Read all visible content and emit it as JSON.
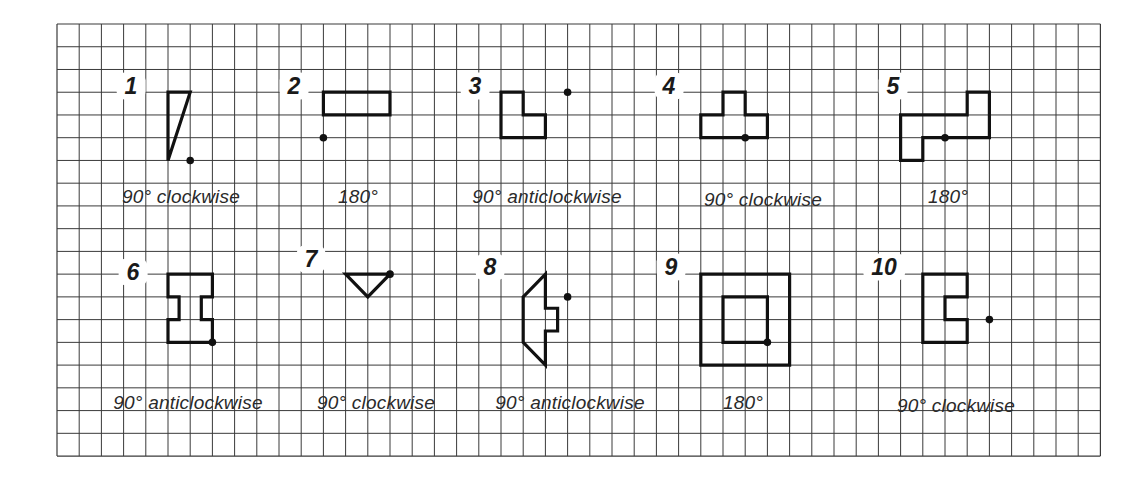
{
  "grid": {
    "left": 57,
    "top": 24,
    "cols": 47,
    "rows": 19,
    "cell_w": 22.2,
    "cell_h": 22.74,
    "line_color": "#3a3a3a",
    "shape_color": "#111111"
  },
  "exercises": [
    {
      "number": "1",
      "instruction": "90° clockwise",
      "number_pos": [
        131,
        86
      ],
      "caption_pos": [
        181,
        197
      ],
      "shapes": [
        [
          [
            5,
            3
          ],
          [
            6,
            3
          ],
          [
            5,
            6
          ]
        ]
      ],
      "centre": [
        6,
        6
      ]
    },
    {
      "number": "2",
      "instruction": "180°",
      "number_pos": [
        294,
        86
      ],
      "caption_pos": [
        358,
        197
      ],
      "shapes": [
        [
          [
            12,
            3
          ],
          [
            15,
            3
          ],
          [
            15,
            4
          ],
          [
            12,
            4
          ]
        ]
      ],
      "centre": [
        12,
        5
      ]
    },
    {
      "number": "3",
      "instruction": "90° anticlockwise",
      "number_pos": [
        475,
        86
      ],
      "caption_pos": [
        547,
        197
      ],
      "shapes": [
        [
          [
            20,
            3
          ],
          [
            21,
            3
          ],
          [
            21,
            4
          ],
          [
            22,
            4
          ],
          [
            22,
            5
          ],
          [
            20,
            5
          ]
        ]
      ],
      "centre": [
        23,
        3
      ]
    },
    {
      "number": "4",
      "instruction": "90° clockwise",
      "number_pos": [
        669,
        86
      ],
      "caption_pos": [
        763,
        200
      ],
      "shapes": [
        [
          [
            30,
            3
          ],
          [
            31,
            3
          ],
          [
            31,
            4
          ],
          [
            32,
            4
          ],
          [
            32,
            5
          ],
          [
            29,
            5
          ],
          [
            29,
            4
          ],
          [
            30,
            4
          ]
        ]
      ],
      "centre": [
        31,
        5
      ]
    },
    {
      "number": "5",
      "instruction": "180°",
      "number_pos": [
        893,
        86
      ],
      "caption_pos": [
        948,
        197
      ],
      "shapes": [
        [
          [
            38,
            4
          ],
          [
            41,
            4
          ],
          [
            41,
            3
          ],
          [
            42,
            3
          ],
          [
            42,
            5
          ],
          [
            39,
            5
          ],
          [
            39,
            6
          ],
          [
            38,
            6
          ]
        ]
      ],
      "centre": [
        40,
        5
      ]
    },
    {
      "number": "6",
      "instruction": "90° anticlockwise",
      "number_pos": [
        133,
        272
      ],
      "caption_pos": [
        188,
        403
      ],
      "shapes": [
        [
          [
            5,
            11
          ],
          [
            7,
            11
          ],
          [
            7,
            12
          ],
          [
            6.5,
            12
          ],
          [
            6.5,
            13
          ],
          [
            7,
            13
          ],
          [
            7,
            14
          ],
          [
            5,
            14
          ],
          [
            5,
            13
          ],
          [
            5.5,
            13
          ],
          [
            5.5,
            12
          ],
          [
            5,
            12
          ]
        ]
      ],
      "centre": [
        7,
        14
      ]
    },
    {
      "number": "7",
      "instruction": "90° clockwise",
      "number_pos": [
        311,
        259
      ],
      "caption_pos": [
        376,
        403
      ],
      "shapes": [
        [
          [
            13,
            11
          ],
          [
            15,
            11
          ],
          [
            14,
            12
          ]
        ]
      ],
      "centre": [
        15,
        11
      ]
    },
    {
      "number": "8",
      "instruction": "90° anticlockwise",
      "number_pos": [
        490,
        267
      ],
      "caption_pos": [
        570,
        403
      ],
      "shapes": [
        [
          [
            22,
            11
          ],
          [
            22,
            12.5
          ],
          [
            22.55,
            12.5
          ],
          [
            22.55,
            13.5
          ],
          [
            22,
            13.5
          ],
          [
            22,
            15
          ],
          [
            21,
            14
          ],
          [
            21,
            12
          ]
        ]
      ],
      "centre": [
        23,
        12
      ]
    },
    {
      "number": "9",
      "instruction": "180°",
      "number_pos": [
        671,
        267
      ],
      "caption_pos": [
        743,
        403
      ],
      "shapes": [
        [
          [
            29,
            11
          ],
          [
            33,
            11
          ],
          [
            33,
            15
          ],
          [
            29,
            15
          ]
        ],
        [
          [
            30,
            12
          ],
          [
            32,
            12
          ],
          [
            32,
            14
          ],
          [
            30,
            14
          ]
        ]
      ],
      "centre": [
        32,
        14
      ]
    },
    {
      "number": "10",
      "instruction": "90° clockwise",
      "number_pos": [
        884,
        267
      ],
      "caption_pos": [
        956,
        406
      ],
      "shapes": [
        [
          [
            39,
            11
          ],
          [
            41,
            11
          ],
          [
            41,
            12
          ],
          [
            40,
            12
          ],
          [
            40,
            13
          ],
          [
            41,
            13
          ],
          [
            41,
            14
          ],
          [
            39,
            14
          ]
        ]
      ],
      "centre": [
        42,
        13
      ]
    }
  ]
}
